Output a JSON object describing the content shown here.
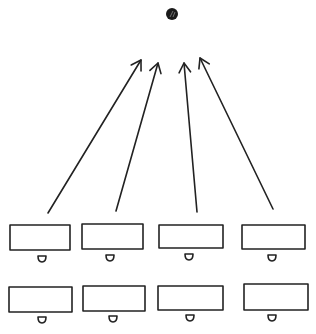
{
  "diagram": {
    "colors": {
      "ink": "#222222",
      "ball": "#1a1a1a",
      "background": "#ffffff"
    },
    "ball": {
      "cx": 172,
      "cy": 14,
      "r": 6
    },
    "arrows": [
      {
        "from": [
          48,
          213
        ],
        "to": [
          141,
          60
        ]
      },
      {
        "from": [
          116,
          211
        ],
        "to": [
          158,
          63
        ]
      },
      {
        "from": [
          197,
          212
        ],
        "to": [
          184,
          63
        ]
      },
      {
        "from": [
          273,
          209
        ],
        "to": [
          200,
          58
        ]
      }
    ],
    "desks": [
      {
        "row": 1,
        "x": 10,
        "y": 225,
        "w": 60,
        "h": 25,
        "seat": [
          42,
          259
        ]
      },
      {
        "row": 1,
        "x": 82,
        "y": 224,
        "w": 61,
        "h": 25,
        "seat": [
          110,
          258
        ]
      },
      {
        "row": 1,
        "x": 159,
        "y": 225,
        "w": 64,
        "h": 23,
        "seat": [
          189,
          257
        ]
      },
      {
        "row": 1,
        "x": 242,
        "y": 225,
        "w": 63,
        "h": 24,
        "seat": [
          272,
          258
        ]
      },
      {
        "row": 2,
        "x": 9,
        "y": 287,
        "w": 63,
        "h": 25,
        "seat": [
          42,
          320
        ]
      },
      {
        "row": 2,
        "x": 83,
        "y": 286,
        "w": 62,
        "h": 25,
        "seat": [
          113,
          319
        ]
      },
      {
        "row": 2,
        "x": 158,
        "y": 286,
        "w": 65,
        "h": 24,
        "seat": [
          190,
          318
        ]
      },
      {
        "row": 2,
        "x": 244,
        "y": 284,
        "w": 64,
        "h": 26,
        "seat": [
          272,
          318
        ]
      }
    ]
  }
}
